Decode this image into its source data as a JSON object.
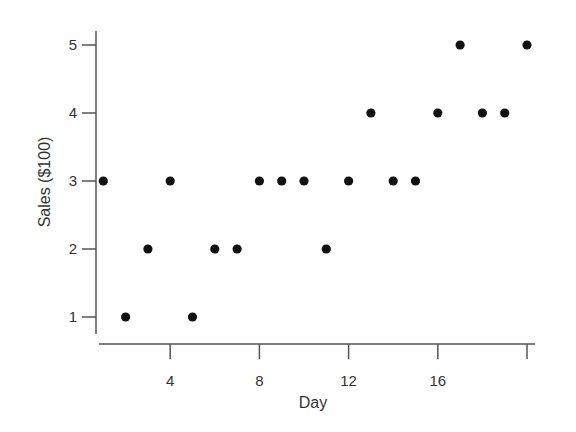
{
  "chart_data": {
    "type": "scatter",
    "title": "",
    "xlabel": "Day",
    "ylabel": "Sales ($100)",
    "x_ticks": [
      4,
      8,
      12,
      16,
      20
    ],
    "x_tick_labels": [
      "4",
      "8",
      "12",
      "16",
      ""
    ],
    "y_ticks": [
      1,
      2,
      3,
      4,
      5
    ],
    "y_tick_labels": [
      "1",
      "2",
      "3",
      "4",
      "5"
    ],
    "xlim": [
      0,
      20.3
    ],
    "ylim": [
      0.6,
      5.2
    ],
    "grid": false,
    "legend": null,
    "marker_color": "#111111",
    "axis_color": "#555555",
    "text_color": "#333333",
    "series": [
      {
        "name": "Sales",
        "x": [
          1,
          2,
          3,
          4,
          5,
          6,
          7,
          8,
          9,
          10,
          11,
          12,
          13,
          14,
          15,
          16,
          17,
          18,
          19,
          20
        ],
        "y": [
          3,
          1,
          2,
          3,
          1,
          2,
          2,
          3,
          3,
          3,
          2,
          3,
          4,
          3,
          3,
          4,
          5,
          4,
          4,
          5
        ]
      }
    ]
  }
}
